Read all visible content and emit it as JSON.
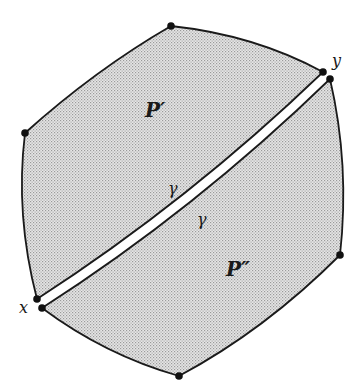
{
  "figure": {
    "colors": {
      "background": "#ffffff",
      "fill": "#d9d9d9",
      "stroke": "#1a1a1a",
      "cut": "#ffffff"
    },
    "labels": {
      "region_upper": "P′",
      "region_lower": "P″",
      "gamma_upper": "γ",
      "gamma_lower": "γ",
      "vertex_x": "x",
      "vertex_y": "y"
    },
    "vertices": [
      {
        "name": "top",
        "x": 171,
        "y": 26
      },
      {
        "name": "y-upper",
        "x": 323,
        "y": 72
      },
      {
        "name": "y-lower",
        "x": 330,
        "y": 79
      },
      {
        "name": "right",
        "x": 340,
        "y": 255
      },
      {
        "name": "bottom",
        "x": 179,
        "y": 376
      },
      {
        "name": "x-lower",
        "x": 42,
        "y": 308
      },
      {
        "name": "x-upper",
        "x": 37,
        "y": 299
      },
      {
        "name": "left",
        "x": 25,
        "y": 133
      }
    ]
  }
}
